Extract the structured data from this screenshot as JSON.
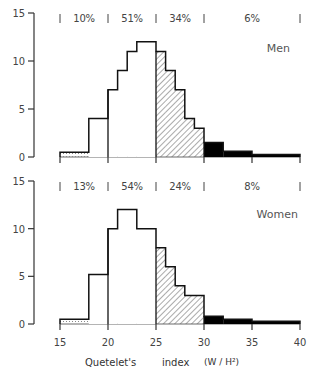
{
  "chart_data": [
    {
      "type": "bar",
      "subtype": "histogram",
      "title": "Men",
      "xlabel": "Quetelet's index (W / H²)",
      "ylabel": "",
      "xlim": [
        15,
        40
      ],
      "ylim": [
        0,
        15
      ],
      "xticks": [
        15,
        20,
        25,
        30,
        35,
        40
      ],
      "yticks": [
        0,
        5,
        10,
        15
      ],
      "grid": false,
      "bins": [
        {
          "from": 15,
          "to": 18,
          "value": 0.5,
          "fill": "dotted"
        },
        {
          "from": 18,
          "to": 20,
          "value": 4,
          "fill": "white"
        },
        {
          "from": 20,
          "to": 21,
          "value": 7,
          "fill": "white"
        },
        {
          "from": 21,
          "to": 22,
          "value": 9,
          "fill": "white"
        },
        {
          "from": 22,
          "to": 23,
          "value": 11,
          "fill": "white"
        },
        {
          "from": 23,
          "to": 25,
          "value": 12,
          "fill": "white"
        },
        {
          "from": 25,
          "to": 26,
          "value": 11,
          "fill": "hatched"
        },
        {
          "from": 26,
          "to": 27,
          "value": 9,
          "fill": "hatched"
        },
        {
          "from": 27,
          "to": 28,
          "value": 7,
          "fill": "hatched"
        },
        {
          "from": 28,
          "to": 29,
          "value": 4,
          "fill": "hatched"
        },
        {
          "from": 29,
          "to": 30,
          "value": 3,
          "fill": "hatched"
        },
        {
          "from": 30,
          "to": 32,
          "value": 1.5,
          "fill": "black"
        },
        {
          "from": 32,
          "to": 35,
          "value": 0.6,
          "fill": "black"
        },
        {
          "from": 35,
          "to": 40,
          "value": 0.25,
          "fill": "black"
        }
      ],
      "group_boundaries": [
        15,
        20,
        25,
        30,
        40
      ],
      "group_percentages": [
        "10%",
        "51%",
        "34%",
        "6%"
      ]
    },
    {
      "type": "bar",
      "subtype": "histogram",
      "title": "Women",
      "xlabel": "Quetelet's index (W / H²)",
      "ylabel": "",
      "xlim": [
        15,
        40
      ],
      "ylim": [
        0,
        15
      ],
      "xticks": [
        15,
        20,
        25,
        30,
        35,
        40
      ],
      "yticks": [
        0,
        5,
        10,
        15
      ],
      "grid": false,
      "bins": [
        {
          "from": 15,
          "to": 18,
          "value": 0.5,
          "fill": "dotted"
        },
        {
          "from": 18,
          "to": 20,
          "value": 5.2,
          "fill": "white"
        },
        {
          "from": 20,
          "to": 21,
          "value": 10,
          "fill": "white"
        },
        {
          "from": 21,
          "to": 23,
          "value": 12,
          "fill": "white"
        },
        {
          "from": 23,
          "to": 25,
          "value": 10,
          "fill": "white"
        },
        {
          "from": 25,
          "to": 26,
          "value": 8,
          "fill": "hatched"
        },
        {
          "from": 26,
          "to": 27,
          "value": 6,
          "fill": "hatched"
        },
        {
          "from": 27,
          "to": 28,
          "value": 4,
          "fill": "hatched"
        },
        {
          "from": 28,
          "to": 30,
          "value": 3,
          "fill": "hatched"
        },
        {
          "from": 30,
          "to": 32,
          "value": 0.8,
          "fill": "black"
        },
        {
          "from": 32,
          "to": 35,
          "value": 0.5,
          "fill": "black"
        },
        {
          "from": 35,
          "to": 40,
          "value": 0.3,
          "fill": "black"
        }
      ],
      "group_boundaries": [
        15,
        20,
        25,
        30,
        40
      ],
      "group_percentages": [
        "13%",
        "54%",
        "24%",
        "8%"
      ]
    }
  ],
  "labels": {
    "xlabel_word1": "Quetelet's",
    "xlabel_word2": "index",
    "xlabel_units": "(W / H²)"
  }
}
